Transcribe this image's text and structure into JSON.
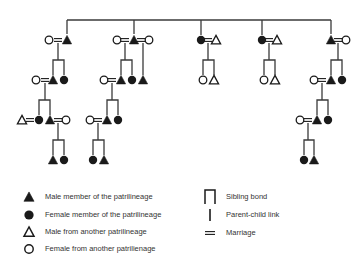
{
  "colors": {
    "ink": "#1a1a1a",
    "line": "#3a3a3a",
    "text": "#333333",
    "background": "#ffffff"
  },
  "diagram": {
    "top_line": {
      "y": 20,
      "x1": 67,
      "x2": 331
    },
    "drops": [
      {
        "x": 67,
        "y1": 20,
        "y2": 34
      },
      {
        "x": 134,
        "y1": 20,
        "y2": 34
      },
      {
        "x": 201,
        "y1": 20,
        "y2": 35
      },
      {
        "x": 262,
        "y1": 20,
        "y2": 35
      },
      {
        "x": 331,
        "y1": 20,
        "y2": 34
      }
    ],
    "nodes": [
      {
        "id": "g1a-wife",
        "type": "female-other",
        "x": 49,
        "y": 40
      },
      {
        "id": "g1a-husband",
        "type": "male-member",
        "x": 67,
        "y": 40
      },
      {
        "id": "g2a-wife",
        "type": "female-other",
        "x": 36,
        "y": 80
      },
      {
        "id": "g2a-son",
        "type": "male-member",
        "x": 53,
        "y": 80
      },
      {
        "id": "g2a-daughter",
        "type": "female-member",
        "x": 64,
        "y": 80
      },
      {
        "id": "g3a-husband",
        "type": "male-other",
        "x": 22,
        "y": 120
      },
      {
        "id": "g3a-daughter",
        "type": "female-member",
        "x": 39,
        "y": 120
      },
      {
        "id": "g3a-son",
        "type": "male-member",
        "x": 50,
        "y": 120
      },
      {
        "id": "g3a-wife",
        "type": "female-other",
        "x": 66,
        "y": 120
      },
      {
        "id": "g4a-son",
        "type": "male-member",
        "x": 53,
        "y": 160
      },
      {
        "id": "g4a-daughter",
        "type": "female-member",
        "x": 64,
        "y": 160
      },
      {
        "id": "g1b-wife1",
        "type": "female-other",
        "x": 117,
        "y": 40
      },
      {
        "id": "g1b-husband",
        "type": "male-member",
        "x": 134,
        "y": 40
      },
      {
        "id": "g1b-wife2",
        "type": "female-other",
        "x": 149,
        "y": 40
      },
      {
        "id": "g2b-wife",
        "type": "female-other",
        "x": 104,
        "y": 80
      },
      {
        "id": "g2b-son",
        "type": "male-member",
        "x": 121,
        "y": 80
      },
      {
        "id": "g2b-daughter",
        "type": "female-member",
        "x": 132,
        "y": 80
      },
      {
        "id": "g2b-son2",
        "type": "male-member",
        "x": 143,
        "y": 80
      },
      {
        "id": "g3b-wife",
        "type": "female-other",
        "x": 90,
        "y": 120
      },
      {
        "id": "g3b-son",
        "type": "male-member",
        "x": 107,
        "y": 120
      },
      {
        "id": "g3b-daughter",
        "type": "female-member",
        "x": 118,
        "y": 120
      },
      {
        "id": "g4b-daughter",
        "type": "female-member",
        "x": 93,
        "y": 160
      },
      {
        "id": "g4b-son",
        "type": "male-member",
        "x": 104,
        "y": 160
      },
      {
        "id": "g1c-wife",
        "type": "female-member",
        "x": 201,
        "y": 40
      },
      {
        "id": "g1c-husband",
        "type": "male-other",
        "x": 216,
        "y": 40
      },
      {
        "id": "g2c-daughter",
        "type": "female-other",
        "x": 203,
        "y": 80
      },
      {
        "id": "g2c-son",
        "type": "male-other",
        "x": 214,
        "y": 80
      },
      {
        "id": "g1d-wife",
        "type": "female-member",
        "x": 262,
        "y": 40
      },
      {
        "id": "g1d-husband",
        "type": "male-other",
        "x": 277,
        "y": 40
      },
      {
        "id": "g2d-daughter",
        "type": "female-other",
        "x": 264,
        "y": 80
      },
      {
        "id": "g2d-son",
        "type": "male-other",
        "x": 275,
        "y": 80
      },
      {
        "id": "g1e-husband",
        "type": "male-member",
        "x": 331,
        "y": 40
      },
      {
        "id": "g1e-wife",
        "type": "female-other",
        "x": 346,
        "y": 40
      },
      {
        "id": "g2e-wife",
        "type": "female-other",
        "x": 314,
        "y": 80
      },
      {
        "id": "g2e-son",
        "type": "male-member",
        "x": 331,
        "y": 80
      },
      {
        "id": "g2e-daughter",
        "type": "female-member",
        "x": 342,
        "y": 80
      },
      {
        "id": "g3e-wife",
        "type": "female-other",
        "x": 300,
        "y": 120
      },
      {
        "id": "g3e-son",
        "type": "male-member",
        "x": 317,
        "y": 120
      },
      {
        "id": "g3e-daughter",
        "type": "female-member",
        "x": 328,
        "y": 120
      },
      {
        "id": "g4e-daughter",
        "type": "female-member",
        "x": 304,
        "y": 160
      },
      {
        "id": "g4e-son",
        "type": "male-member",
        "x": 314,
        "y": 160
      }
    ],
    "marriages": [
      {
        "x": 58,
        "y": 40
      },
      {
        "x": 45,
        "y": 80
      },
      {
        "x": 30,
        "y": 120
      },
      {
        "x": 58,
        "y": 120
      },
      {
        "x": 125,
        "y": 40
      },
      {
        "x": 141,
        "y": 40
      },
      {
        "x": 112,
        "y": 80
      },
      {
        "x": 98,
        "y": 120
      },
      {
        "x": 208,
        "y": 40
      },
      {
        "x": 269,
        "y": 40
      },
      {
        "x": 338,
        "y": 40
      },
      {
        "x": 322,
        "y": 80
      },
      {
        "x": 308,
        "y": 120
      }
    ],
    "descents": [
      {
        "x": 58,
        "y1": 43,
        "y2": 60,
        "bond": [
          53,
          64
        ],
        "child_y": 75
      },
      {
        "x": 45,
        "y1": 83,
        "y2": 100,
        "bond": [
          39,
          50
        ],
        "child_y": 115
      },
      {
        "x": 58,
        "y1": 123,
        "y2": 140,
        "bond": [
          53,
          64
        ],
        "child_y": 155
      },
      {
        "x": 125,
        "y1": 43,
        "y2": 60,
        "bond": [
          121,
          132
        ],
        "child_y": 75
      },
      {
        "x": 112,
        "y1": 83,
        "y2": 100,
        "bond": [
          107,
          118
        ],
        "child_y": 115
      },
      {
        "x": 98,
        "y1": 123,
        "y2": 140,
        "bond": [
          93,
          104
        ],
        "child_y": 155
      },
      {
        "x": 208,
        "y1": 43,
        "y2": 60,
        "bond": [
          203,
          214
        ],
        "child_y": 75
      },
      {
        "x": 269,
        "y1": 43,
        "y2": 60,
        "bond": [
          264,
          275
        ],
        "child_y": 75
      },
      {
        "x": 338,
        "y1": 43,
        "y2": 60,
        "bond": [
          331,
          342
        ],
        "child_y": 75
      },
      {
        "x": 322,
        "y1": 83,
        "y2": 100,
        "bond": [
          317,
          328
        ],
        "child_y": 115
      },
      {
        "x": 308,
        "y1": 123,
        "y2": 140,
        "bond": [
          304,
          314
        ],
        "child_y": 155
      }
    ],
    "single_links": [
      {
        "x": 143,
        "y1": 43,
        "y2": 75
      }
    ]
  },
  "legend": {
    "left": [
      {
        "icon": "male-member",
        "label": "Male member of the patrilineage"
      },
      {
        "icon": "female-member",
        "label": "Female member of the patrilineage"
      },
      {
        "icon": "male-other",
        "label": "Male from another patrilineage"
      },
      {
        "icon": "female-other",
        "label": "Female from another patrilienage"
      }
    ],
    "right": [
      {
        "icon": "sibling-bond",
        "label": "Sibling bond"
      },
      {
        "icon": "parent-child-link",
        "label": "Parent-child link"
      },
      {
        "icon": "marriage",
        "label": "Marriage"
      }
    ]
  }
}
